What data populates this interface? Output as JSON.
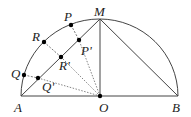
{
  "diagram": {
    "type": "geometry",
    "colors": {
      "stroke": "#444444",
      "point": "#000000",
      "text": "#222222"
    },
    "points": {
      "A": {
        "label": "A",
        "x": 21,
        "y": 96
      },
      "B": {
        "label": "B",
        "x": 178,
        "y": 96
      },
      "O": {
        "label": "O",
        "x": 100,
        "y": 96
      },
      "M": {
        "label": "M",
        "x": 100,
        "y": 19
      },
      "P": {
        "label": "P",
        "x": 71,
        "y": 25
      },
      "R": {
        "label": "R",
        "x": 44,
        "y": 42
      },
      "Q": {
        "label": "Q",
        "x": 24,
        "y": 75
      },
      "P2": {
        "label": "P'",
        "x": 79,
        "y": 40
      },
      "R2": {
        "label": "R'",
        "x": 61,
        "y": 57
      },
      "Q2": {
        "label": "Q'",
        "x": 38,
        "y": 78
      }
    },
    "labels": {
      "A": "A",
      "B": "B",
      "O": "O",
      "M": "M",
      "P": "P",
      "R": "R",
      "Q": "Q",
      "P2": "P'",
      "R2": "R'",
      "Q2": "Q'"
    }
  }
}
